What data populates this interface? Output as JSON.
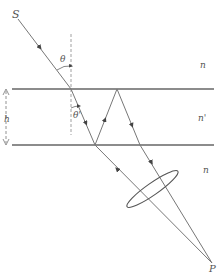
{
  "diagram": {
    "type": "optics-ray-diagram",
    "labels": {
      "source": "S",
      "point": "P",
      "theta": "θ",
      "theta_prime": "θ'",
      "thickness": "h",
      "n_top": "n",
      "n_middle": "n'",
      "n_bottom": "n"
    },
    "elements": [
      "incident ray",
      "top interface",
      "bottom interface",
      "refracted ray",
      "reflected ray",
      "lens",
      "focal point"
    ]
  }
}
